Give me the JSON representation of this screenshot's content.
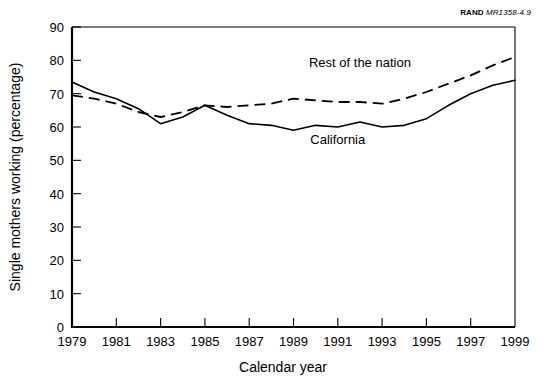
{
  "source_tag": {
    "brand": "RAND",
    "doc_id": "MR1358-4.9"
  },
  "chart_data": {
    "type": "line",
    "title": "",
    "xlabel": "Calendar year",
    "ylabel": "Single mothers working (percentage)",
    "xlim": [
      1979,
      1999
    ],
    "ylim": [
      0,
      90
    ],
    "grid": false,
    "legend": "inline-annotations",
    "xticks": [
      1979,
      1981,
      1983,
      1985,
      1987,
      1989,
      1991,
      1993,
      1995,
      1997,
      1999
    ],
    "xtick_labels": [
      "1979",
      "1981",
      "1983",
      "1985",
      "1987",
      "1989",
      "1991",
      "1993",
      "1995",
      "1997",
      "1999"
    ],
    "yticks": [
      0,
      10,
      20,
      30,
      40,
      50,
      60,
      70,
      80,
      90
    ],
    "ytick_labels": [
      "0",
      "10",
      "20",
      "30",
      "40",
      "50",
      "60",
      "70",
      "80",
      "90"
    ],
    "x": [
      1979,
      1980,
      1981,
      1982,
      1983,
      1984,
      1985,
      1986,
      1987,
      1988,
      1989,
      1990,
      1991,
      1992,
      1993,
      1994,
      1995,
      1996,
      1997,
      1998,
      1999
    ],
    "series": [
      {
        "name": "California",
        "style": "solid",
        "label": "California",
        "label_x": 1991.0,
        "label_y": 55.0,
        "values": [
          73.5,
          70.5,
          68.5,
          65.5,
          61.0,
          63.0,
          66.5,
          63.5,
          61.0,
          60.5,
          59.0,
          60.5,
          60.0,
          61.5,
          60.0,
          60.5,
          62.5,
          66.5,
          70.0,
          72.5,
          74.0
        ]
      },
      {
        "name": "Rest of the nation",
        "style": "dashed",
        "label": "Rest of the nation",
        "label_x": 1992.0,
        "label_y": 78.0,
        "values": [
          69.5,
          68.5,
          67.0,
          64.5,
          63.0,
          64.5,
          66.5,
          66.0,
          66.5,
          67.0,
          68.5,
          68.0,
          67.5,
          67.5,
          67.0,
          68.5,
          70.5,
          73.0,
          75.5,
          78.5,
          81.0
        ]
      }
    ]
  }
}
